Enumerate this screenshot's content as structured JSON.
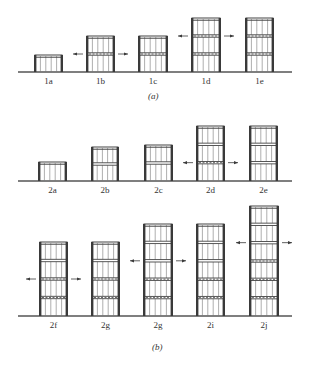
{
  "figure": {
    "panel_a": {
      "caption": "(a)",
      "ground_y": 72,
      "buildings": [
        {
          "label": "1a",
          "x": 35,
          "w": 27,
          "top": 55,
          "floors": 1,
          "braced": [],
          "arrow_floor": null
        },
        {
          "label": "1b",
          "x": 87,
          "w": 27,
          "top": 36,
          "floors": 2,
          "braced": [
            1
          ],
          "arrow_floor": 1
        },
        {
          "label": "1c",
          "x": 139,
          "w": 28,
          "top": 36,
          "floors": 2,
          "braced": [
            1
          ],
          "arrow_floor": null
        },
        {
          "label": "1d",
          "x": 192,
          "w": 28,
          "top": 18,
          "floors": 3,
          "braced": [
            1,
            2
          ],
          "arrow_floor": 2
        },
        {
          "label": "1e",
          "x": 246,
          "w": 27,
          "top": 18,
          "floors": 3,
          "braced": [
            1,
            2
          ],
          "arrow_floor": null
        }
      ]
    },
    "panel_b_row1": {
      "ground_y": 181,
      "buildings": [
        {
          "label": "2a",
          "x": 39,
          "w": 27,
          "top": 162,
          "floors": 1,
          "braced": [],
          "arrow_floor": null
        },
        {
          "label": "2b",
          "x": 92,
          "w": 26,
          "top": 147,
          "floors": 2,
          "braced": [],
          "arrow_floor": null
        },
        {
          "label": "2c",
          "x": 145,
          "w": 27,
          "top": 145,
          "floors": 2,
          "braced": [],
          "arrow_floor": null
        },
        {
          "label": "2d",
          "x": 197,
          "w": 27,
          "top": 126,
          "floors": 3,
          "braced": [
            1
          ],
          "arrow_floor": 1
        },
        {
          "label": "2e",
          "x": 250,
          "w": 27,
          "top": 126,
          "floors": 3,
          "braced": [],
          "arrow_floor": null
        }
      ]
    },
    "panel_b_row2": {
      "caption": "(b)",
      "ground_y": 316,
      "buildings": [
        {
          "label": "2f",
          "x": 40,
          "w": 27,
          "top": 242,
          "floors": 4,
          "braced": [
            1,
            2
          ],
          "arrow_floor": 2
        },
        {
          "label": "2g",
          "x": 92,
          "w": 27,
          "top": 242,
          "floors": 4,
          "braced": [
            1,
            2
          ],
          "arrow_floor": null
        },
        {
          "label": "2g",
          "x": 144,
          "w": 28,
          "top": 224,
          "floors": 5,
          "braced": [
            1,
            2
          ],
          "arrow_floor": 3
        },
        {
          "label": "2i",
          "x": 197,
          "w": 27,
          "top": 224,
          "floors": 5,
          "braced": [
            1,
            2
          ],
          "arrow_floor": null
        },
        {
          "label": "2j",
          "x": 250,
          "w": 28,
          "top": 206,
          "floors": 6,
          "braced": [
            1,
            2,
            3
          ],
          "arrow_floor": 4
        }
      ]
    },
    "colors": {
      "line": "#3a3a3a",
      "ground": "#555555",
      "slab": "#444444",
      "mullion": "#777777"
    }
  }
}
